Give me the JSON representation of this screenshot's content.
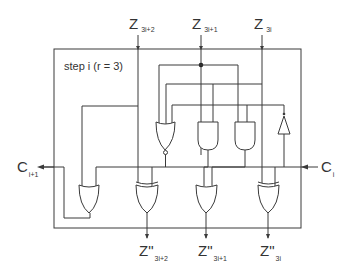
{
  "diagram": {
    "title": "step i (r = 3)",
    "colors": {
      "line": "#3a3a3a",
      "text": "#333333",
      "background": "#ffffff"
    },
    "inputs": [
      {
        "name": "Z",
        "sub": "3i+2"
      },
      {
        "name": "Z",
        "sub": "3i+1"
      },
      {
        "name": "Z",
        "sub": "3i"
      }
    ],
    "outputs": [
      {
        "name": "Z\"",
        "sub": "3i+2"
      },
      {
        "name": "Z\"",
        "sub": "3i+1"
      },
      {
        "name": "Z\"",
        "sub": "3i"
      }
    ],
    "carry_in": {
      "name": "C",
      "sub": "i"
    },
    "carry_out": {
      "name": "C",
      "sub": "i+1"
    },
    "gates": [
      {
        "type": "NOR",
        "row": "top"
      },
      {
        "type": "AND",
        "row": "top"
      },
      {
        "type": "AND",
        "row": "top"
      },
      {
        "type": "BUFFER",
        "row": "top"
      },
      {
        "type": "OR",
        "row": "bottom"
      },
      {
        "type": "XOR",
        "row": "bottom"
      },
      {
        "type": "OR",
        "row": "bottom"
      },
      {
        "type": "XOR",
        "row": "bottom"
      }
    ]
  }
}
